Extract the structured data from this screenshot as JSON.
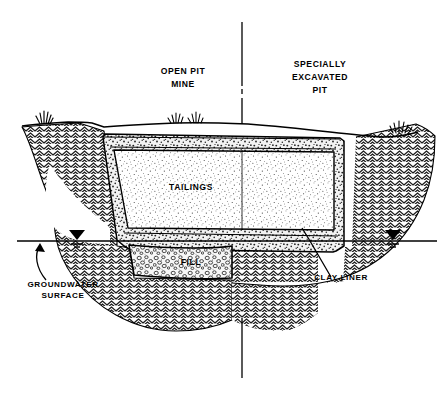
{
  "figure": {
    "kind": "engineering-cross-section",
    "background_color": "#ffffff",
    "line_color": "#000000"
  },
  "center_divider": {
    "name": "center-dividing-line",
    "description": "vertical line separating the two halves of the section, broken by a short gap near the top"
  },
  "labels": {
    "left_scenario_line1": "OPEN PIT",
    "left_scenario_line2": "MINE",
    "right_scenario_line1": "SPECIALLY",
    "right_scenario_line2": "EXCAVATED",
    "right_scenario_line3": "PIT",
    "tailings": "TAILINGS",
    "fill": "FILL",
    "clay_liner": "CLAY LINER",
    "groundwater_line1": "GROUNDWATER",
    "groundwater_line2": "SURFACE"
  },
  "regions": [
    {
      "id": "native-soil",
      "label": "",
      "hatch": "chevron-zigzag",
      "description": "undisturbed native ground surrounding and beneath the pit"
    },
    {
      "id": "clay-liner",
      "label": "CLAY LINER",
      "hatch": "coarse-speckle",
      "description": "compacted clay liner band lining the sides and base of the excavation"
    },
    {
      "id": "tailings",
      "label": "TAILINGS",
      "hatch": "fine-stipple",
      "description": "tailings mass filling the lined pit"
    },
    {
      "id": "fill",
      "label": "FILL",
      "hatch": "pebble-gravel",
      "description": "granular fill placed below the clay liner base"
    }
  ],
  "symbols": [
    {
      "id": "water-table-left",
      "name": "groundwater-table-symbol",
      "glyph": "filled-triangle-with-stacked-bars"
    },
    {
      "id": "water-table-right",
      "name": "groundwater-table-symbol",
      "glyph": "filled-triangle-with-stacked-bars"
    },
    {
      "id": "groundwater-leader",
      "name": "curved-leader-arrow",
      "glyph": "curved-arrow"
    },
    {
      "id": "clay-liner-leader",
      "name": "straight-leader-line",
      "glyph": "line"
    },
    {
      "id": "grass-tuft-left",
      "name": "grass-tuft-icon",
      "glyph": "grass"
    },
    {
      "id": "grass-tuft-center-a",
      "name": "grass-tuft-icon",
      "glyph": "grass"
    },
    {
      "id": "grass-tuft-center-b",
      "name": "grass-tuft-icon",
      "glyph": "grass"
    },
    {
      "id": "grass-tuft-right",
      "name": "grass-tuft-icon",
      "glyph": "grass"
    }
  ],
  "lines": {
    "ground_surface": "undulating natural ground surface line across the pit opening",
    "groundwater_surface": "horizontal water table line spanning the full figure width"
  }
}
